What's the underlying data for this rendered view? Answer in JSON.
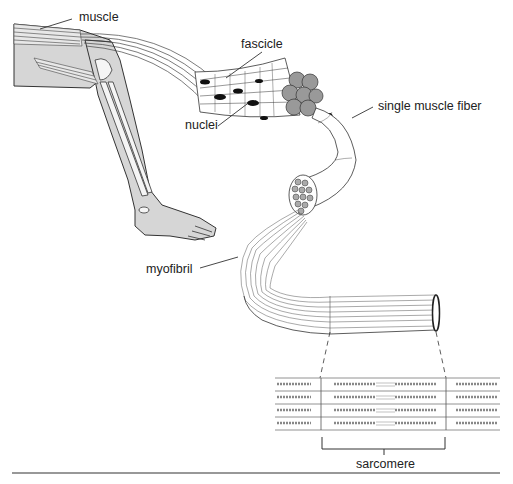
{
  "diagram": {
    "labels": {
      "muscle": "muscle",
      "fascicle": "fascicle",
      "nuclei": "nuclei",
      "single_muscle_fiber": "single muscle fiber",
      "myofibril": "myofibril",
      "sarcomere": "sarcomere"
    },
    "colors": {
      "line": "#2a2a2a",
      "fill_gray": "#d6d6d6",
      "nucleus": "#111111",
      "background": "#ffffff"
    }
  }
}
